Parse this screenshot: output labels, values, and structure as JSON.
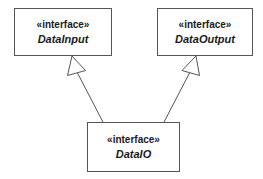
{
  "diagram": {
    "type": "uml-class-diagram",
    "title": "",
    "background_color": "#ffffff",
    "line_color": "#555555",
    "text_color": "#1a1a1a",
    "fill_color": "#ffffff",
    "nodes": [
      {
        "id": "datainput",
        "stereotype": "«interface»",
        "name": "DataInput",
        "shape": "rectangle",
        "x": 14,
        "y": 8,
        "width": 98,
        "height": 48
      },
      {
        "id": "dataoutput",
        "stereotype": "«interface»",
        "name": "DataOutput",
        "shape": "rectangle",
        "x": 157,
        "y": 8,
        "width": 96,
        "height": 48
      },
      {
        "id": "dataio",
        "stereotype": "«interface»",
        "name": "DataIO",
        "shape": "rectangle",
        "x": 87,
        "y": 122,
        "width": 93,
        "height": 50
      }
    ],
    "edges": [
      {
        "id": "dataio-to-datainput",
        "from": "dataio",
        "to": "datainput",
        "relation": "generalization",
        "arrowhead": "hollow-triangle",
        "line_style": "solid",
        "label": ""
      },
      {
        "id": "dataio-to-dataoutput",
        "from": "dataio",
        "to": "dataoutput",
        "relation": "generalization",
        "arrowhead": "hollow-triangle",
        "line_style": "solid",
        "label": ""
      }
    ]
  }
}
